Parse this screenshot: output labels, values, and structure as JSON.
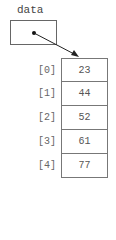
{
  "variable": {
    "name": "data"
  },
  "array": {
    "indices": [
      "[0]",
      "[1]",
      "[2]",
      "[3]",
      "[4]"
    ],
    "values": [
      "23",
      "44",
      "52",
      "61",
      "77"
    ]
  }
}
